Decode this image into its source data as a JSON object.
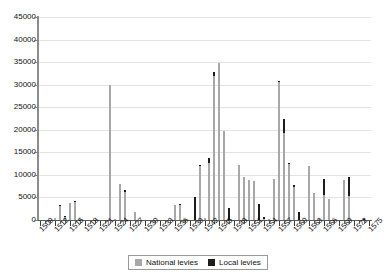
{
  "chart_data": {
    "type": "bar",
    "title": "",
    "subtitle": "",
    "xlabel": "",
    "ylabel": "",
    "stacked": true,
    "grid": true,
    "legend_position": "bottom",
    "ylim": [
      0,
      45000
    ],
    "ytick_step": 5000,
    "ytick_labels": [
      "0",
      "5000",
      "10000",
      "15000",
      "20000",
      "25000",
      "30000",
      "35000",
      "40000",
      "45000"
    ],
    "xlim": [
      1509,
      1575
    ],
    "xtick_step": 3,
    "xtick_labels": [
      "1509",
      "1512",
      "1515",
      "1518",
      "1521",
      "1524",
      "1527",
      "1530",
      "1533",
      "1536",
      "1539",
      "1542",
      "1545",
      "1548",
      "1551",
      "1554",
      "1557",
      "1560",
      "1563",
      "1566",
      "1569",
      "1572",
      "1575"
    ],
    "categories": [
      1509,
      1510,
      1511,
      1512,
      1513,
      1514,
      1515,
      1516,
      1517,
      1518,
      1519,
      1520,
      1521,
      1522,
      1523,
      1524,
      1525,
      1526,
      1527,
      1528,
      1529,
      1530,
      1531,
      1532,
      1533,
      1534,
      1535,
      1536,
      1537,
      1538,
      1539,
      1540,
      1541,
      1542,
      1543,
      1544,
      1545,
      1546,
      1547,
      1548,
      1549,
      1550,
      1551,
      1552,
      1553,
      1554,
      1555,
      1556,
      1557,
      1558,
      1559,
      1560,
      1561,
      1562,
      1563,
      1564,
      1565,
      1566,
      1567,
      1568,
      1569,
      1570,
      1571,
      1572,
      1573,
      1574,
      1575
    ],
    "series": [
      {
        "name": "National levies",
        "color": "#a8a8a8",
        "values": [
          0,
          0,
          0,
          500,
          3000,
          600,
          3800,
          3900,
          400,
          0,
          0,
          0,
          0,
          0,
          30000,
          200,
          8000,
          6300,
          0,
          1700,
          0,
          0,
          0,
          0,
          0,
          0,
          0,
          3300,
          3300,
          300,
          0,
          0,
          11900,
          500,
          12700,
          31900,
          34900,
          19700,
          0,
          0,
          12200,
          9500,
          8900,
          8700,
          0,
          300,
          300,
          9200,
          30500,
          19200,
          12400,
          7400,
          0,
          0,
          11900,
          5900,
          100,
          5600,
          4600,
          0,
          0,
          8800,
          5400,
          0,
          0,
          0,
          0
        ],
        "note": "gray lower segment of each stacked bar"
      },
      {
        "name": "Local levies",
        "color": "#1c1c1c",
        "values": [
          0,
          0,
          0,
          0,
          100,
          400,
          0,
          100,
          0,
          0,
          0,
          0,
          0,
          0,
          0,
          0,
          0,
          100,
          0,
          0,
          0,
          0,
          0,
          0,
          0,
          0,
          0,
          0,
          200,
          0,
          0,
          5200,
          100,
          0,
          1100,
          1000,
          0,
          0,
          2700,
          0,
          0,
          0,
          0,
          0,
          3600,
          300,
          0,
          0,
          100,
          3300,
          100,
          100,
          1700,
          0,
          0,
          0,
          0,
          3500,
          0,
          0,
          0,
          0,
          4100,
          0,
          0,
          100,
          0
        ],
        "note": "black upper segment stacked on top of national levies"
      }
    ],
    "totals_note": "Each vertical bar is a stack: gray National levies at the base, black Local levies on top."
  },
  "legend": {
    "items": [
      {
        "label": "National levies",
        "swatch": "gray-swatch-icon",
        "color": "#a8a8a8"
      },
      {
        "label": "Local levies",
        "swatch": "black-swatch-icon",
        "color": "#1c1c1c"
      }
    ]
  },
  "axis": {
    "y_axis_name": "y-axis",
    "x_axis_name": "x-axis"
  }
}
